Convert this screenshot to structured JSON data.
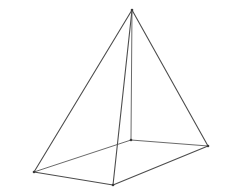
{
  "figure": {
    "name": "wireframe-pyramid",
    "title": "",
    "background_color": "#ffffff",
    "line_color": "#4d4d4d",
    "hidden_line_color": "#6b6b6b",
    "line_width": 1.1,
    "canvas": {
      "width": 238,
      "height": 194
    },
    "vertices": [
      {
        "id": "apex",
        "label": "apex",
        "x": 132,
        "y": 10,
        "visible": true
      },
      {
        "id": "left",
        "label": "base-left",
        "x": 34,
        "y": 172,
        "visible": true
      },
      {
        "id": "front",
        "label": "base-front",
        "x": 113,
        "y": 185,
        "visible": true
      },
      {
        "id": "right",
        "label": "base-right",
        "x": 208,
        "y": 146,
        "visible": true
      },
      {
        "id": "back",
        "label": "base-back",
        "x": 131,
        "y": 140,
        "visible": true
      }
    ],
    "edges": [
      {
        "id": "apex-left",
        "from": "apex",
        "to": "left",
        "hidden": false
      },
      {
        "id": "apex-front",
        "from": "apex",
        "to": "front",
        "hidden": false
      },
      {
        "id": "apex-right",
        "from": "apex",
        "to": "right",
        "hidden": false
      },
      {
        "id": "apex-back",
        "from": "apex",
        "to": "back",
        "hidden": true
      },
      {
        "id": "base-left-front",
        "from": "left",
        "to": "front",
        "hidden": false
      },
      {
        "id": "base-front-right",
        "from": "front",
        "to": "right",
        "hidden": false
      },
      {
        "id": "base-right-back",
        "from": "right",
        "to": "back",
        "hidden": true
      },
      {
        "id": "base-back-left",
        "from": "back",
        "to": "left",
        "hidden": true
      }
    ]
  }
}
